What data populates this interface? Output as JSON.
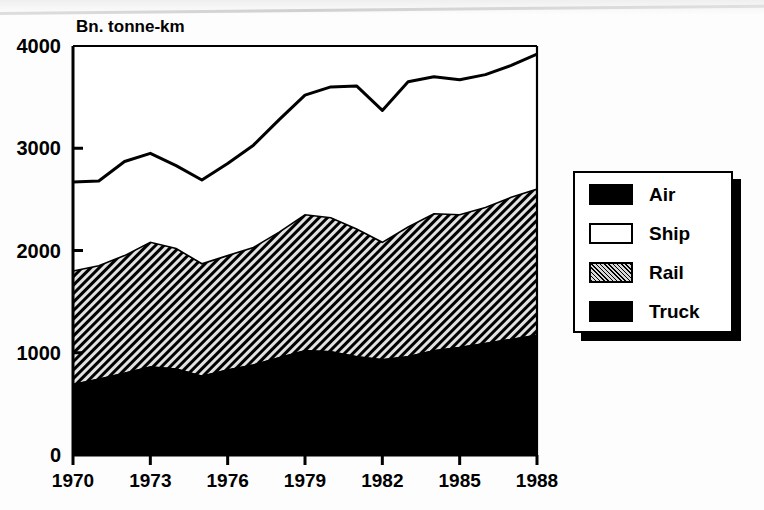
{
  "chart_data": {
    "type": "area",
    "stacked": true,
    "title": "Bn. tonne-km",
    "subtitle": "",
    "xlabel": "",
    "ylabel": "Bn. tonne-km",
    "ylim": [
      0,
      4000
    ],
    "xlim": [
      1970,
      1988
    ],
    "yticks": [
      0,
      1000,
      2000,
      3000,
      4000
    ],
    "ytick_labels": [
      "0",
      "1000",
      "2000",
      "3000",
      "4000"
    ],
    "xticks": [
      1970,
      1973,
      1976,
      1979,
      1982,
      1985,
      1988
    ],
    "xtick_labels": [
      "1970",
      "1973",
      "1976",
      "1979",
      "1982",
      "1985",
      "1988"
    ],
    "grid": false,
    "legend_position": "right",
    "x": [
      1970,
      1971,
      1972,
      1973,
      1974,
      1975,
      1976,
      1977,
      1978,
      1979,
      1980,
      1981,
      1982,
      1983,
      1984,
      1985,
      1986,
      1987,
      1988
    ],
    "categories": [
      "1970",
      "1971",
      "1972",
      "1973",
      "1974",
      "1975",
      "1976",
      "1977",
      "1978",
      "1979",
      "1980",
      "1981",
      "1982",
      "1983",
      "1984",
      "1985",
      "1986",
      "1987",
      "1988"
    ],
    "series": [
      {
        "name": "Truck",
        "fill": "solid-black",
        "color": "#000000",
        "values": [
          690,
          740,
          800,
          860,
          840,
          770,
          830,
          880,
          950,
          1020,
          1010,
          960,
          930,
          960,
          1020,
          1050,
          1090,
          1130,
          1170
        ]
      },
      {
        "name": "Rail",
        "fill": "diagonal-hatch",
        "color": "#565656",
        "values": [
          1110,
          1110,
          1150,
          1220,
          1180,
          1100,
          1120,
          1150,
          1230,
          1330,
          1310,
          1250,
          1150,
          1270,
          1340,
          1300,
          1330,
          1390,
          1430
        ]
      },
      {
        "name": "Ship",
        "fill": "white",
        "color": "#ffffff",
        "values": [
          870,
          830,
          920,
          870,
          810,
          820,
          900,
          1000,
          1100,
          1170,
          1280,
          1400,
          1290,
          1420,
          1340,
          1320,
          1300,
          1290,
          1320
        ]
      },
      {
        "name": "Air",
        "fill": "solid-black",
        "color": "#000000",
        "values": [
          0,
          0,
          0,
          0,
          0,
          0,
          0,
          0,
          0,
          0,
          0,
          0,
          0,
          0,
          0,
          0,
          0,
          0,
          0
        ]
      }
    ],
    "cumulative": {
      "truck_top": [
        690,
        740,
        800,
        860,
        840,
        770,
        830,
        880,
        950,
        1020,
        1010,
        960,
        930,
        960,
        1020,
        1050,
        1090,
        1130,
        1170
      ],
      "rail_top": [
        1800,
        1850,
        1950,
        2080,
        2020,
        1870,
        1950,
        2030,
        2180,
        2350,
        2320,
        2210,
        2080,
        2230,
        2360,
        2350,
        2420,
        2520,
        2600
      ],
      "ship_top": [
        2670,
        2680,
        2870,
        2950,
        2830,
        2690,
        2850,
        3030,
        3280,
        3520,
        3600,
        3610,
        3370,
        3650,
        3700,
        3670,
        3720,
        3810,
        3920
      ]
    },
    "total_line": {
      "name": "Total",
      "values": [
        2670,
        2680,
        2870,
        2950,
        2830,
        2690,
        2850,
        3030,
        3280,
        3520,
        3600,
        3610,
        3370,
        3650,
        3700,
        3670,
        3720,
        3810,
        3920
      ]
    }
  },
  "legend": {
    "items": [
      {
        "label": "Air",
        "swatch": "solid-black"
      },
      {
        "label": "Ship",
        "swatch": "white"
      },
      {
        "label": "Rail",
        "swatch": "diagonal-hatch"
      },
      {
        "label": "Truck",
        "swatch": "solid-black"
      }
    ]
  },
  "colors": {
    "ink": "#000000",
    "paper": "#ffffff",
    "hatch_mid": "#565656"
  }
}
